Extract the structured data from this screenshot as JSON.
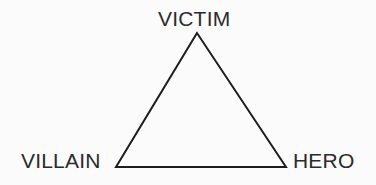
{
  "diagram": {
    "type": "triangle-diagram",
    "background_color": "#fbfbfb",
    "stroke_color": "#1d1d1d",
    "text_color": "#2b2b2b",
    "stroke_width": 2,
    "nodes": [
      {
        "id": "victim",
        "label": "VICTIM",
        "position": "top",
        "vertex_x": 197,
        "vertex_y": 33
      },
      {
        "id": "villain",
        "label": "VILLAIN",
        "position": "bottom-left",
        "vertex_x": 116,
        "vertex_y": 167
      },
      {
        "id": "hero",
        "label": "HERO",
        "position": "bottom-right",
        "vertex_x": 286,
        "vertex_y": 167
      }
    ],
    "edges": [
      {
        "from": "villain",
        "to": "victim"
      },
      {
        "from": "victim",
        "to": "hero"
      },
      {
        "from": "hero",
        "to": "villain"
      }
    ]
  }
}
